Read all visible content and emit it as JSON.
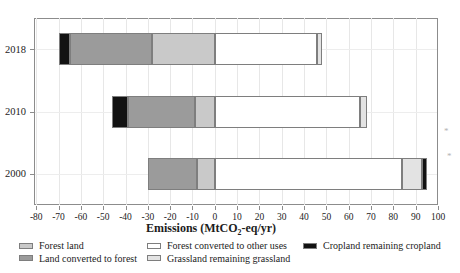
{
  "figure": {
    "xlabel_prefix": "Emissions (MtCO",
    "xlabel_sub": "2",
    "xlabel_suffix": "-eq/yr)"
  },
  "chart_data": {
    "type": "bar",
    "orientation": "horizontal",
    "stacked": true,
    "title": "",
    "xlabel": "Emissions (MtCO2-eq/yr)",
    "ylabel": "",
    "xlim": [
      -80,
      100
    ],
    "xticks": [
      -80,
      -70,
      -60,
      -50,
      -40,
      -30,
      -20,
      -10,
      0,
      10,
      20,
      30,
      40,
      50,
      60,
      70,
      80,
      90,
      100
    ],
    "grid": true,
    "legend_position": "bottom",
    "categories": [
      "2018",
      "2010",
      "2000"
    ],
    "legend": [
      {
        "key": "forest_land",
        "label": "Forest land",
        "color": "#c9c9c9",
        "col": 0,
        "row": 0
      },
      {
        "key": "land_converted_to_forest",
        "label": "Land converted to forest",
        "color": "#9b9b9b",
        "col": 0,
        "row": 1
      },
      {
        "key": "forest_converted_to_other_uses",
        "label": "Forest converted to other uses",
        "color": "#ffffff",
        "col": 1,
        "row": 0
      },
      {
        "key": "grassland_remaining_grassland",
        "label": "Grassland remaining grassland",
        "color": "#e3e3e3",
        "col": 1,
        "row": 1
      },
      {
        "key": "cropland_remaining_cropland",
        "label": "Cropland remaining cropland",
        "color": "#121212",
        "col": 2,
        "row": 0
      }
    ],
    "rows": [
      {
        "label": "2018",
        "segments": [
          {
            "key": "cropland_remaining_cropland",
            "from": -70,
            "to": -65
          },
          {
            "key": "land_converted_to_forest",
            "from": -65,
            "to": -28
          },
          {
            "key": "forest_land",
            "from": -28,
            "to": 0
          },
          {
            "key": "forest_converted_to_other_uses",
            "from": 0,
            "to": 46
          },
          {
            "key": "grassland_remaining_grassland",
            "from": 46,
            "to": 48
          }
        ]
      },
      {
        "label": "2010",
        "segments": [
          {
            "key": "cropland_remaining_cropland",
            "from": -46,
            "to": -39
          },
          {
            "key": "land_converted_to_forest",
            "from": -39,
            "to": -9
          },
          {
            "key": "forest_land",
            "from": -9,
            "to": 0
          },
          {
            "key": "forest_converted_to_other_uses",
            "from": 0,
            "to": 65
          },
          {
            "key": "grassland_remaining_grassland",
            "from": 65,
            "to": 68
          }
        ]
      },
      {
        "label": "2000",
        "segments": [
          {
            "key": "land_converted_to_forest",
            "from": -30,
            "to": -8
          },
          {
            "key": "forest_land",
            "from": -8,
            "to": 0
          },
          {
            "key": "forest_converted_to_other_uses",
            "from": 0,
            "to": 84
          },
          {
            "key": "grassland_remaining_grassland",
            "from": 84,
            "to": 93
          },
          {
            "key": "cropland_remaining_cropland",
            "from": 93,
            "to": 95
          }
        ]
      }
    ],
    "colors": {
      "frame": "#8c8c8c",
      "segment_border": "#7e7e7e",
      "grid": "#e7e7e7",
      "text": "#1c1c1c"
    },
    "stray_marks": [
      {
        "text": "*"
      },
      {
        "text": "*"
      }
    ]
  }
}
